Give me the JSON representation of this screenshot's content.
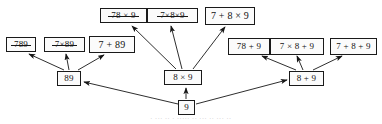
{
  "diagram": {
    "colors": {
      "box_border": "#1a1a1a",
      "box_fill": "#fbfbfb",
      "text": "#121212",
      "edge": "#161616",
      "caption": "#b9b9b9",
      "background": "#ffffff"
    },
    "nodes": [
      {
        "id": "root",
        "label": "9",
        "pruned": false,
        "x": 178,
        "y": 100,
        "w": 17,
        "h": 15,
        "fs": 9
      },
      {
        "id": "mid-left",
        "label": "89",
        "pruned": false,
        "x": 57,
        "y": 71,
        "w": 24,
        "h": 15,
        "fs": 9
      },
      {
        "id": "mid-center",
        "label": "8 × 9",
        "pruned": false,
        "x": 164,
        "y": 70,
        "w": 38,
        "h": 15,
        "fs": 9
      },
      {
        "id": "mid-right",
        "label": "8 + 9",
        "pruned": false,
        "x": 289,
        "y": 71,
        "w": 35,
        "h": 15,
        "fs": 9
      },
      {
        "id": "leaf-l1",
        "label": "789",
        "pruned": true,
        "x": 6,
        "y": 37,
        "w": 30,
        "h": 15,
        "fs": 9
      },
      {
        "id": "leaf-l2",
        "label": "7×89",
        "pruned": true,
        "x": 44,
        "y": 37,
        "w": 41,
        "h": 15,
        "fs": 9
      },
      {
        "id": "leaf-l3",
        "label": "7 + 89",
        "pruned": false,
        "x": 89,
        "y": 36,
        "w": 46,
        "h": 17,
        "fs": 10
      },
      {
        "id": "leaf-c1",
        "label": "78 × 9",
        "pruned": true,
        "x": 100,
        "y": 8,
        "w": 47,
        "h": 15,
        "fs": 9
      },
      {
        "id": "leaf-c2",
        "label": "7×8×9",
        "pruned": true,
        "x": 147,
        "y": 8,
        "w": 51,
        "h": 15,
        "fs": 9
      },
      {
        "id": "leaf-c3",
        "label": "7 + 8 × 9",
        "pruned": false,
        "x": 205,
        "y": 7,
        "w": 50,
        "h": 18,
        "fs": 10
      },
      {
        "id": "leaf-r1",
        "label": "78 + 9",
        "pruned": false,
        "x": 228,
        "y": 38,
        "w": 42,
        "h": 17,
        "fs": 9
      },
      {
        "id": "leaf-r2",
        "label": "7 × 8 + 9",
        "pruned": false,
        "x": 270,
        "y": 38,
        "w": 54,
        "h": 17,
        "fs": 9
      },
      {
        "id": "leaf-r3",
        "label": "7 + 8 + 9",
        "pruned": false,
        "x": 330,
        "y": 38,
        "w": 47,
        "h": 17,
        "fs": 9
      }
    ],
    "edges": [
      {
        "from": "root",
        "to": "mid-left",
        "x1": 178,
        "y1": 104,
        "x2": 84,
        "y2": 82
      },
      {
        "from": "root",
        "to": "mid-center",
        "x1": 186,
        "y1": 99,
        "x2": 186,
        "y2": 88
      },
      {
        "from": "root",
        "to": "mid-right",
        "x1": 196,
        "y1": 104,
        "x2": 287,
        "y2": 80
      },
      {
        "from": "mid-left",
        "to": "leaf-l1",
        "x1": 64,
        "y1": 70,
        "x2": 29,
        "y2": 54
      },
      {
        "from": "mid-left",
        "to": "leaf-l2",
        "x1": 69,
        "y1": 70,
        "x2": 66,
        "y2": 54
      },
      {
        "from": "mid-left",
        "to": "leaf-l3",
        "x1": 78,
        "y1": 70,
        "x2": 104,
        "y2": 55
      },
      {
        "from": "mid-center",
        "to": "leaf-c1",
        "x1": 176,
        "y1": 69,
        "x2": 132,
        "y2": 26
      },
      {
        "from": "mid-center",
        "to": "leaf-c2",
        "x1": 182,
        "y1": 69,
        "x2": 171,
        "y2": 26
      },
      {
        "from": "mid-center",
        "to": "leaf-c3",
        "x1": 193,
        "y1": 69,
        "x2": 225,
        "y2": 27
      },
      {
        "from": "mid-right",
        "to": "leaf-r1",
        "x1": 296,
        "y1": 70,
        "x2": 262,
        "y2": 56
      },
      {
        "from": "mid-right",
        "to": "leaf-r2",
        "x1": 303,
        "y1": 70,
        "x2": 297,
        "y2": 56
      },
      {
        "from": "mid-right",
        "to": "leaf-r3",
        "x1": 313,
        "y1": 70,
        "x2": 342,
        "y2": 56
      }
    ],
    "caption": {
      "text": "· ··· ·· · ····· ··   ··· ·· ··· ··",
      "x": 0,
      "y": 116
    }
  }
}
